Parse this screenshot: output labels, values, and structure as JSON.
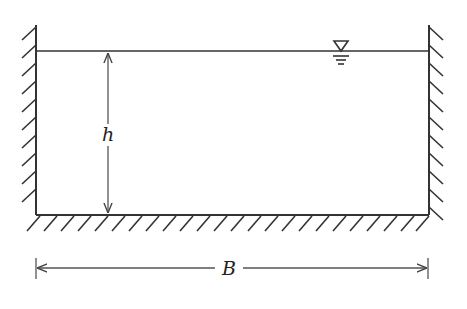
{
  "diagram": {
    "labels": {
      "depth": "h",
      "width": "B"
    },
    "symbols": {
      "water_surface": "free-surface-triangle"
    },
    "colors": {
      "stroke": "#333333",
      "background": "#ffffff"
    }
  }
}
